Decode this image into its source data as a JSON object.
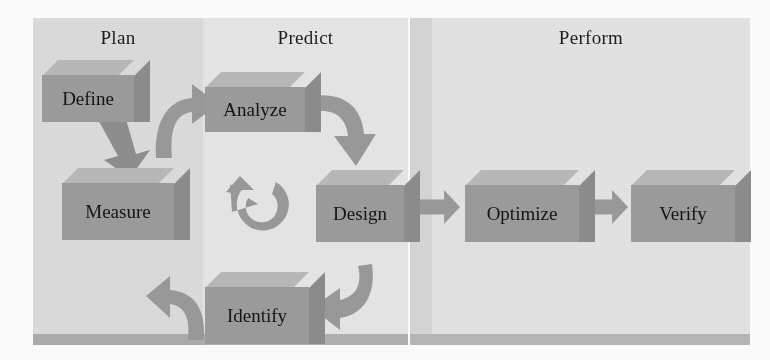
{
  "diagram": {
    "type": "process-flow",
    "colors": {
      "box_front": "#9c9c9c",
      "box_top": "#b9b9b9",
      "box_side": "#8d8d8d",
      "arrow": "#9a9a9a",
      "panel_plan": "#dcdcdc",
      "panel_predict": "#e6e6e6",
      "panel_perform": "#e4e4e4",
      "panel_band": "#b2b2b2",
      "text": "#141414"
    },
    "phases": [
      {
        "id": "plan",
        "label": "Plan",
        "x": 33,
        "y": 18,
        "w": 170,
        "h": 327
      },
      {
        "id": "predict",
        "label": "Predict",
        "x": 203,
        "y": 18,
        "w": 205,
        "h": 327
      },
      {
        "id": "perform",
        "label": "Perform",
        "x": 410,
        "y": 18,
        "w": 340,
        "h": 327
      }
    ],
    "steps": [
      {
        "id": "define",
        "label": "Define",
        "phase": "plan",
        "x": 42,
        "y": 60,
        "w": 92,
        "h": 62
      },
      {
        "id": "measure",
        "label": "Measure",
        "phase": "plan",
        "x": 62,
        "y": 168,
        "w": 112,
        "h": 72
      },
      {
        "id": "analyze",
        "label": "Analyze",
        "phase": "predict",
        "x": 205,
        "y": 72,
        "w": 100,
        "h": 60
      },
      {
        "id": "design",
        "label": "Design",
        "phase": "predict",
        "x": 316,
        "y": 170,
        "w": 88,
        "h": 72
      },
      {
        "id": "identify",
        "label": "Identify",
        "phase": "predict",
        "x": 205,
        "y": 272,
        "w": 104,
        "h": 72
      },
      {
        "id": "optimize",
        "label": "Optimize",
        "phase": "perform",
        "x": 465,
        "y": 170,
        "w": 114,
        "h": 72
      },
      {
        "id": "verify",
        "label": "Verify",
        "phase": "perform",
        "x": 631,
        "y": 170,
        "w": 104,
        "h": 72
      }
    ],
    "connectors": [
      {
        "id": "define-to-measure",
        "from": "define",
        "to": "measure",
        "shape": "straight-down"
      },
      {
        "id": "measure-to-analyze",
        "from": "measure",
        "to": "analyze",
        "shape": "curved-up-right"
      },
      {
        "id": "analyze-to-design",
        "from": "analyze",
        "to": "design",
        "shape": "curved-down-right"
      },
      {
        "id": "design-to-identify",
        "from": "design",
        "to": "identify",
        "shape": "curved-down-left"
      },
      {
        "id": "identify-to-measure",
        "from": "identify",
        "to": "measure",
        "shape": "curved-up-left"
      },
      {
        "id": "iteration-loop",
        "from": "identify",
        "to": "analyze",
        "shape": "circular-counterclockwise"
      },
      {
        "id": "design-to-optimize",
        "from": "design",
        "to": "optimize",
        "shape": "straight-right"
      },
      {
        "id": "optimize-to-verify",
        "from": "optimize",
        "to": "verify",
        "shape": "straight-right"
      }
    ]
  }
}
